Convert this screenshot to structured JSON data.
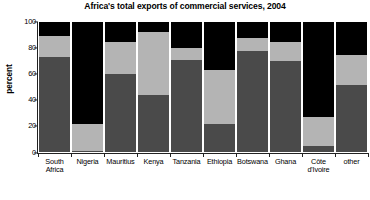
{
  "chart_data": {
    "type": "bar",
    "subtype": "stacked-bar-100",
    "title": "Africa's total exports of commercial services, 2004",
    "xlabel": "",
    "ylabel": "percent",
    "ylim": [
      0,
      100
    ],
    "yticks": [
      0,
      20,
      40,
      60,
      80,
      100
    ],
    "grid": false,
    "legend": "none",
    "stack_order": "bottom-to-top",
    "categories": [
      "South Africa",
      "Nigeria",
      "Mauritius",
      "Kenya",
      "Tanzania",
      "Ethiopia",
      "Botswana",
      "Ghana",
      "Côte d'Ivoire",
      "other"
    ],
    "category_label_lines": [
      [
        "South",
        "Africa"
      ],
      [
        "Nigeria"
      ],
      [
        "Mauritius"
      ],
      [
        "Kenya"
      ],
      [
        "Tanzania"
      ],
      [
        "Ethiopia"
      ],
      [
        "Botswana"
      ],
      [
        "Ghana"
      ],
      [
        "Côte",
        "d'Ivoire"
      ],
      [
        "other"
      ]
    ],
    "series": [
      {
        "name": "segment-bottom",
        "color": "#4a4a4a",
        "values": [
          73,
          1,
          60,
          44,
          71,
          22,
          78,
          70,
          5,
          52
        ]
      },
      {
        "name": "segment-middle",
        "color": "#b4b4b4",
        "values": [
          16,
          21,
          25,
          48,
          9,
          41,
          10,
          15,
          22,
          23
        ]
      },
      {
        "name": "segment-top",
        "color": "#000000",
        "values": [
          11,
          78,
          15,
          8,
          20,
          37,
          12,
          15,
          73,
          25
        ]
      }
    ],
    "cumulative_tops": [
      [
        73,
        89,
        100
      ],
      [
        1,
        22,
        100
      ],
      [
        60,
        85,
        100
      ],
      [
        44,
        92,
        100
      ],
      [
        71,
        80,
        100
      ],
      [
        22,
        63,
        100
      ],
      [
        78,
        88,
        100
      ],
      [
        70,
        85,
        100
      ],
      [
        5,
        27,
        100
      ],
      [
        52,
        75,
        100
      ]
    ]
  },
  "colors": {
    "axis": "#222222",
    "background": "#ffffff",
    "segment_bottom": "#4a4a4a",
    "segment_middle": "#b4b4b4",
    "segment_top": "#000000"
  }
}
